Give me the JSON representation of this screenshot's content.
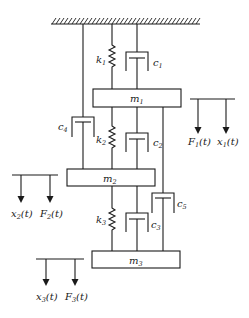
{
  "diagram": {
    "type": "three-mass spring-damper system",
    "ceiling": {
      "name": "fixed-support"
    },
    "masses": [
      {
        "id": "m1",
        "label": "m",
        "sub": "1"
      },
      {
        "id": "m2",
        "label": "m",
        "sub": "2"
      },
      {
        "id": "m3",
        "label": "m",
        "sub": "3"
      }
    ],
    "springs": [
      {
        "id": "k1",
        "label": "k",
        "sub": "1",
        "connects": [
          "ceiling",
          "m1"
        ]
      },
      {
        "id": "k2",
        "label": "k",
        "sub": "2",
        "connects": [
          "m1",
          "m2"
        ]
      },
      {
        "id": "k3",
        "label": "k",
        "sub": "3",
        "connects": [
          "m2",
          "m3"
        ]
      }
    ],
    "dampers": [
      {
        "id": "c1",
        "label": "c",
        "sub": "1",
        "connects": [
          "ceiling",
          "m1"
        ]
      },
      {
        "id": "c2",
        "label": "c",
        "sub": "2",
        "connects": [
          "m1",
          "m2"
        ]
      },
      {
        "id": "c3",
        "label": "c",
        "sub": "3",
        "connects": [
          "m2",
          "m3"
        ]
      },
      {
        "id": "c4",
        "label": "c",
        "sub": "4",
        "connects": [
          "ceiling",
          "m2"
        ]
      },
      {
        "id": "c5",
        "label": "c",
        "sub": "5",
        "connects": [
          "m1",
          "m3"
        ]
      }
    ],
    "arrow_groups": [
      {
        "id": "group1",
        "first": {
          "label": "F",
          "sub": "1",
          "arg": "(t)"
        },
        "second": {
          "label": "x",
          "sub": "1",
          "arg": "(t)"
        }
      },
      {
        "id": "group2",
        "first": {
          "label": "x",
          "sub": "2",
          "arg": "(t)"
        },
        "second": {
          "label": "F",
          "sub": "2",
          "arg": "(t)"
        }
      },
      {
        "id": "group3",
        "first": {
          "label": "x",
          "sub": "3",
          "arg": "(t)"
        },
        "second": {
          "label": "F",
          "sub": "3",
          "arg": "(t)"
        }
      }
    ]
  }
}
